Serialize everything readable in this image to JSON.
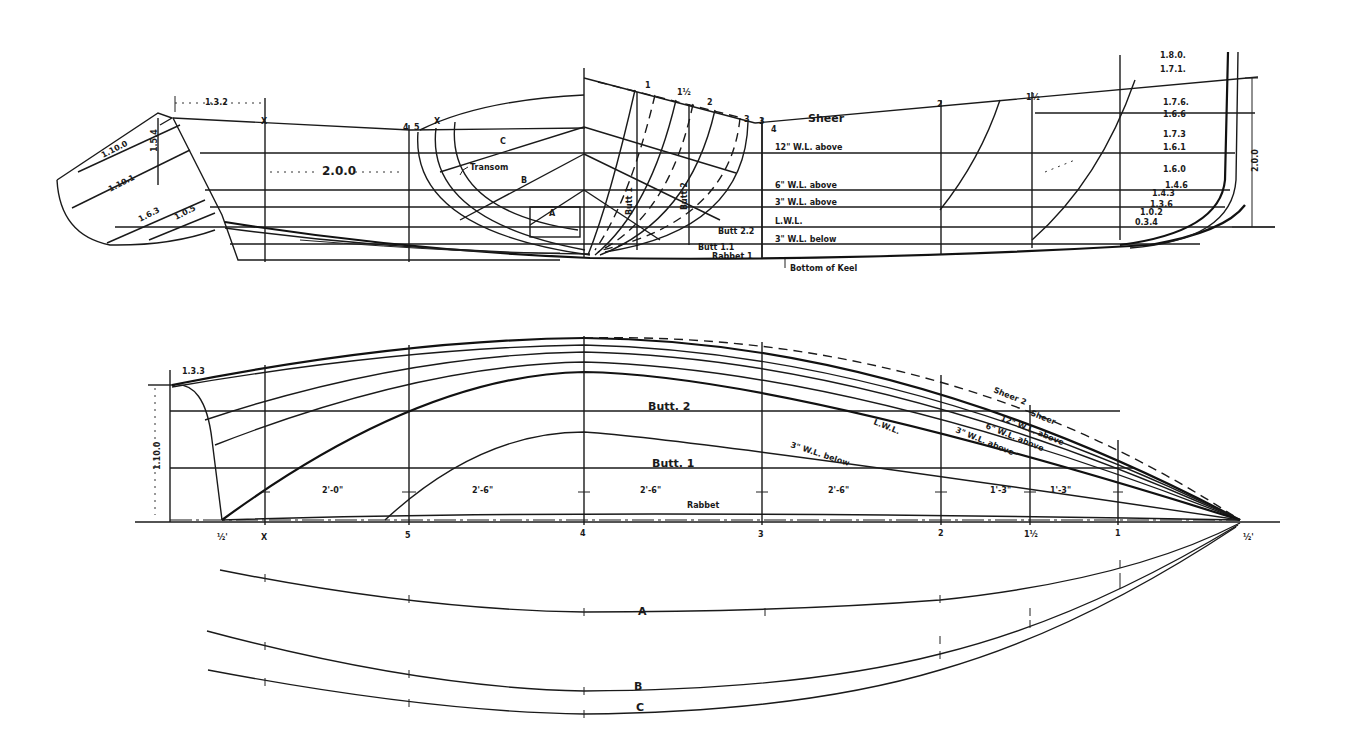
{
  "drawing": {
    "type": "boat lines plan",
    "views": [
      "profile-and-body-plan",
      "half-breadth-plan",
      "diagonals"
    ]
  },
  "profile": {
    "station_labels": {
      "x_aft": "X",
      "s5": "5",
      "s4": "4",
      "s3": "3",
      "s2": "2",
      "s1_half": "1½",
      "bp_x": "X",
      "bp_5": "5",
      "bp_1": "1",
      "bp_1half": "1½",
      "bp_2": "2",
      "bp_3a": "3",
      "bp_3b": "3",
      "bp_4": "4"
    },
    "dimensions": {
      "transom_top": "1.3.2",
      "transom_rake": "1.5.4",
      "transom_d1": "1.10.0",
      "transom_d2": "1.10.1",
      "transom_d3": "1.6.3",
      "transom_d4": "1.0.5",
      "transom_d5": "1.0.7.4",
      "midbody": "2.0.0",
      "overall_height": "2.0.0"
    },
    "waterlines": {
      "sheer": "Sheer",
      "wl12": "12\" W.L. above",
      "wl6": "6\" W.L. above",
      "wl3": "3\" W.L. above",
      "lwl": "L.W.L.",
      "wl3b": "3\" W.L. below",
      "butt22": "Butt 2.2",
      "butt1": "Butt 1.1",
      "rabbet": "Rabbet 1",
      "keel": "Bottom of Keel"
    },
    "body_plan": {
      "transom": "Transom",
      "diag_a": "A",
      "diag_b": "B",
      "diag_c": "C",
      "butt_label_1": "Butt 1",
      "butt_label_2": "Butt 2"
    },
    "stem_offsets": [
      "1.8.0.",
      "1.7.1.",
      "1.7.6.",
      "1.6.6",
      "1.7.3",
      "1.6.1",
      "1.6.0",
      "1.4.6",
      "1.4.3",
      "1.3.6",
      "1.0.2",
      "0.3.4"
    ]
  },
  "half_breadth": {
    "station_labels": [
      "½'",
      "X",
      "5",
      "4",
      "3",
      "2",
      "1½",
      "1",
      "½'"
    ],
    "spacings": [
      "2'-0\"",
      "2'-6\"",
      "2'-6\"",
      "2'-6\"",
      "2'-6\"",
      "1'-3\"",
      "1'-3\""
    ],
    "dimensions": {
      "transom_half": "1.3.3",
      "transom_height": "1.10.0"
    },
    "line_labels": {
      "sheer2": "Sheer 2",
      "sheer": "Sheer",
      "wl12": "12\" W.L. above",
      "wl6": "6\" W.L. above",
      "wl3": "3\" W.L. above",
      "lwl": "L.W.L.",
      "wl3b": "3\" W.L. below",
      "butt2": "Butt. 2",
      "butt1": "Butt. 1",
      "rabbet": "Rabbet"
    }
  },
  "diagonals": {
    "labels": [
      "A",
      "B",
      "C"
    ]
  }
}
